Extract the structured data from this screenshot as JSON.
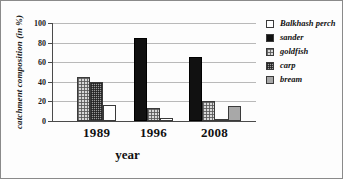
{
  "chart_data": {
    "type": "bar",
    "title": "",
    "xlabel": "year",
    "ylabel": "catchment composition (in %)",
    "categories": [
      "1989",
      "1996",
      "2008"
    ],
    "ylim": [
      0,
      100
    ],
    "yticks": [
      0,
      20,
      40,
      60,
      80,
      100
    ],
    "ytick_labels": [
      "0",
      "20",
      "40",
      "60",
      "80",
      "100"
    ],
    "grid": true,
    "legend_position": "right",
    "series": [
      {
        "name": "Balkhash perch",
        "swatch": "white-empty",
        "values": [
          16,
          3,
          0
        ]
      },
      {
        "name": "sander",
        "swatch": "solid-black",
        "values": [
          0,
          85,
          65
        ]
      },
      {
        "name": "goldfish",
        "swatch": "light-checker",
        "values": [
          45,
          13,
          20
        ]
      },
      {
        "name": "carp",
        "swatch": "dark-dotted",
        "values": [
          40,
          0,
          2
        ]
      },
      {
        "name": "bream",
        "swatch": "medium-gray",
        "values": [
          0,
          0,
          15
        ]
      }
    ],
    "bars": [
      {
        "group": "1989",
        "series": "goldfish",
        "value": 45,
        "pattern": "goldfish"
      },
      {
        "group": "1989",
        "series": "carp",
        "value": 40,
        "pattern": "carp"
      },
      {
        "group": "1989",
        "series": "Balkhash perch",
        "value": 16,
        "pattern": "perch"
      },
      {
        "group": "1996",
        "series": "sander",
        "value": 85,
        "pattern": "sander"
      },
      {
        "group": "1996",
        "series": "goldfish",
        "value": 13,
        "pattern": "goldfish"
      },
      {
        "group": "1996",
        "series": "Balkhash perch",
        "value": 3,
        "pattern": "perch"
      },
      {
        "group": "2008",
        "series": "sander",
        "value": 65,
        "pattern": "sander"
      },
      {
        "group": "2008",
        "series": "goldfish",
        "value": 20,
        "pattern": "goldfish"
      },
      {
        "group": "2008",
        "series": "carp",
        "value": 2,
        "pattern": "carp"
      },
      {
        "group": "2008",
        "series": "bream",
        "value": 15,
        "pattern": "bream"
      }
    ]
  },
  "legend": {
    "items": [
      {
        "label": "Balkhash perch",
        "pattern": "perch"
      },
      {
        "label": "sander",
        "pattern": "sander"
      },
      {
        "label": "goldfish",
        "pattern": "goldfish"
      },
      {
        "label": "carp",
        "pattern": "carp"
      },
      {
        "label": "bream",
        "pattern": "bream"
      }
    ]
  },
  "colors": {
    "axis": "#4a4a4a",
    "grid": "#b9b9b9",
    "sander": "#111111",
    "goldfish": "#d9d9d9",
    "carp": "#9a9a9a",
    "bream": "#a8a8a8",
    "perch": "#ffffff",
    "text": "#111111"
  }
}
